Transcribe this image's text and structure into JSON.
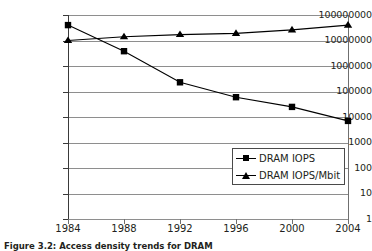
{
  "chart_data": {
    "type": "line",
    "title": "",
    "xlabel": "",
    "ylabel": "",
    "x": [
      1984,
      1988,
      1992,
      1996,
      2000,
      2004
    ],
    "categories": [
      "1984",
      "1988",
      "1992",
      "1996",
      "2000",
      "2004"
    ],
    "yscale": "log",
    "ylim": [
      1,
      100000000
    ],
    "ytick_labels": [
      "100000000",
      "10000000",
      "1000000",
      "100000",
      "10000",
      "1000",
      "100",
      "10",
      "1"
    ],
    "ytick_values": [
      100000000,
      10000000,
      1000000,
      100000,
      10000,
      1000,
      100,
      10,
      1
    ],
    "grid": true,
    "legend_position": "lower right",
    "series": [
      {
        "name": "DRAM IOPS",
        "marker": "square",
        "values": [
          40000000,
          3800000,
          230000,
          60000,
          25000,
          7000
        ]
      },
      {
        "name": "DRAM IOPS/Mbit",
        "marker": "triangle",
        "values": [
          10000000,
          14000000,
          17000000,
          19000000,
          26000000,
          40000000
        ]
      }
    ]
  },
  "axes": {
    "y_ticks": [
      {
        "label": "100000000",
        "value": 100000000
      },
      {
        "label": "10000000",
        "value": 10000000
      },
      {
        "label": "1000000",
        "value": 1000000
      },
      {
        "label": "100000",
        "value": 100000
      },
      {
        "label": "10000",
        "value": 10000
      },
      {
        "label": "1000",
        "value": 1000
      },
      {
        "label": "100",
        "value": 100
      },
      {
        "label": "10",
        "value": 10
      },
      {
        "label": "1",
        "value": 1
      }
    ],
    "x_ticks": [
      {
        "label": "1984"
      },
      {
        "label": "1988"
      },
      {
        "label": "1992"
      },
      {
        "label": "1996"
      },
      {
        "label": "2000"
      },
      {
        "label": "2004"
      }
    ]
  },
  "legend": {
    "items": [
      {
        "label": "DRAM IOPS",
        "marker": "square"
      },
      {
        "label": "DRAM IOPS/Mbit",
        "marker": "triangle"
      }
    ]
  },
  "caption": {
    "text": "Figure 3.2: Access density trends for DRAM"
  },
  "colors": {
    "series": "#000000",
    "grid": "#8e8e8e",
    "axis": "#3a3a3a",
    "text": "#231f20",
    "background": "#ffffff"
  }
}
